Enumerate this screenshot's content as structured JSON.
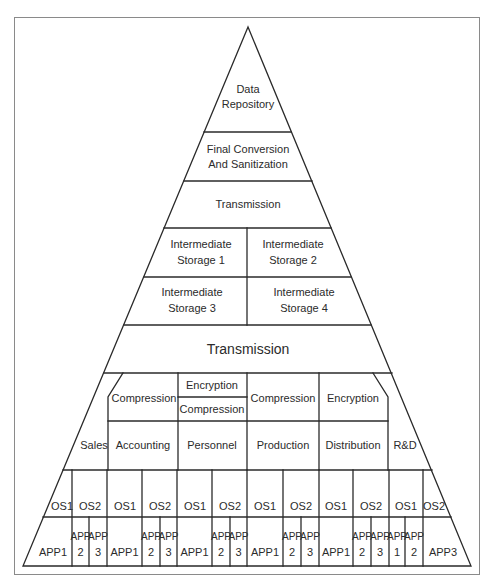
{
  "diagram": {
    "type": "layered pyramid",
    "levels": [
      {
        "name": "apex",
        "cells": [
          {
            "lines": [
              "Data",
              "Repository"
            ]
          }
        ]
      },
      {
        "name": "final-conversion",
        "cells": [
          {
            "lines": [
              "Final Conversion",
              "And Sanitization"
            ]
          }
        ]
      },
      {
        "name": "transmission-upper",
        "cells": [
          {
            "lines": [
              "Transmission"
            ]
          }
        ]
      },
      {
        "name": "intermediate-storage-row-1",
        "cells": [
          {
            "lines": [
              "Intermediate",
              "Storage 1"
            ]
          },
          {
            "lines": [
              "Intermediate",
              "Storage 2"
            ]
          }
        ]
      },
      {
        "name": "intermediate-storage-row-2",
        "cells": [
          {
            "lines": [
              "Intermediate",
              "Storage 3"
            ]
          },
          {
            "lines": [
              "Intermediate",
              "Storage 4"
            ]
          }
        ]
      },
      {
        "name": "transmission-lower",
        "cells": [
          {
            "lines": [
              "Transmission"
            ]
          }
        ]
      },
      {
        "name": "processing",
        "cells": [
          {
            "lines": [
              "Compression"
            ]
          },
          {
            "lines": [
              "Encryption"
            ]
          },
          {
            "lines": [
              "Compression"
            ]
          },
          {
            "lines": [
              "Compression"
            ]
          },
          {
            "lines": [
              "Encryption"
            ]
          }
        ]
      },
      {
        "name": "departments",
        "cells": [
          {
            "lines": [
              "Sales"
            ]
          },
          {
            "lines": [
              "Accounting"
            ]
          },
          {
            "lines": [
              "Personnel"
            ]
          },
          {
            "lines": [
              "Production"
            ]
          },
          {
            "lines": [
              "Distribution"
            ]
          },
          {
            "lines": [
              "R&D"
            ]
          }
        ]
      },
      {
        "name": "operating-systems",
        "cells": [
          {
            "lines": [
              "OS1"
            ]
          },
          {
            "lines": [
              "OS2"
            ]
          },
          {
            "lines": [
              "OS1"
            ]
          },
          {
            "lines": [
              "OS2"
            ]
          },
          {
            "lines": [
              "OS1"
            ]
          },
          {
            "lines": [
              "OS2"
            ]
          },
          {
            "lines": [
              "OS1"
            ]
          },
          {
            "lines": [
              "OS2"
            ]
          },
          {
            "lines": [
              "OS1"
            ]
          },
          {
            "lines": [
              "OS2"
            ]
          },
          {
            "lines": [
              "OS1"
            ]
          },
          {
            "lines": [
              "OS2"
            ]
          }
        ]
      },
      {
        "name": "applications",
        "cells": [
          {
            "lines": [
              "APP1"
            ]
          },
          {
            "lines": [
              "APP",
              "2"
            ]
          },
          {
            "lines": [
              "APP",
              "3"
            ]
          },
          {
            "lines": [
              "APP1"
            ]
          },
          {
            "lines": [
              "APP",
              "2"
            ]
          },
          {
            "lines": [
              "APP",
              "3"
            ]
          },
          {
            "lines": [
              "APP1"
            ]
          },
          {
            "lines": [
              "APP",
              "2"
            ]
          },
          {
            "lines": [
              "APP",
              "3"
            ]
          },
          {
            "lines": [
              "APP1"
            ]
          },
          {
            "lines": [
              "APP",
              "2"
            ]
          },
          {
            "lines": [
              "APP",
              "3"
            ]
          },
          {
            "lines": [
              "APP1"
            ]
          },
          {
            "lines": [
              "APP",
              "2"
            ]
          },
          {
            "lines": [
              "APP",
              "3"
            ]
          },
          {
            "lines": [
              "APP",
              "1"
            ]
          },
          {
            "lines": [
              "APP",
              "2"
            ]
          },
          {
            "lines": [
              "APP3"
            ]
          }
        ]
      }
    ]
  },
  "colors": {
    "line": "#2a2a2a",
    "text": "#2b2b2b",
    "frame": "#8a8a8a",
    "background": "#ffffff"
  }
}
